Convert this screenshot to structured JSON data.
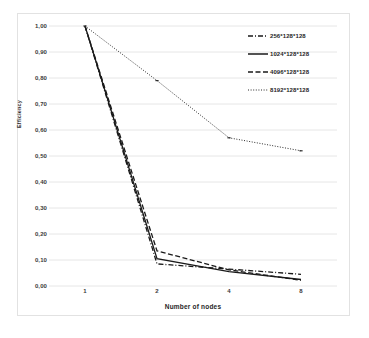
{
  "chart_data": {
    "type": "line",
    "title": "",
    "xlabel": "Number of nodes",
    "ylabel": "Efficiency",
    "categories": [
      "1",
      "2",
      "4",
      "8"
    ],
    "x": [
      1,
      2,
      4,
      8
    ],
    "ylim": [
      0.0,
      1.0
    ],
    "ytick_labels": [
      "0,00",
      "0,10",
      "0,20",
      "0,30",
      "0,40",
      "0,50",
      "0,60",
      "0,70",
      "0,80",
      "0,90",
      "1,00"
    ],
    "ytick_values": [
      0.0,
      0.1,
      0.2,
      0.3,
      0.4,
      0.5,
      0.6,
      0.7,
      0.8,
      0.9,
      1.0
    ],
    "grid": "horizontal",
    "legend_position": "top-right",
    "series": [
      {
        "name": "256*128*128",
        "values": [
          1.0,
          0.085,
          0.065,
          0.045
        ],
        "style": "dash-dot",
        "color": "#1a1a1a"
      },
      {
        "name": "1024*128*128",
        "values": [
          1.0,
          0.105,
          0.055,
          0.025
        ],
        "style": "solid",
        "color": "#1a1a1a"
      },
      {
        "name": "4096*128*128",
        "values": [
          1.0,
          0.135,
          0.062,
          0.022
        ],
        "style": "dashed",
        "color": "#1a1a1a"
      },
      {
        "name": "8192*128*128",
        "values": [
          1.0,
          0.79,
          0.57,
          0.52
        ],
        "style": "dotted",
        "color": "#2b2b2b"
      }
    ]
  },
  "style": {
    "background": "#ffffff",
    "grid_color": "#e6e6e6",
    "frame_color": "#e2e2e2",
    "text_color": "#2b2b2b"
  }
}
